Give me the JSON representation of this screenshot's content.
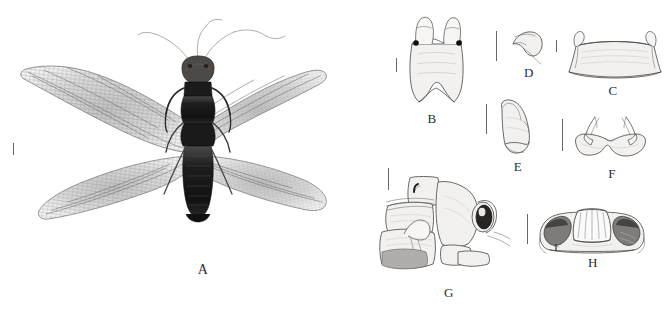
{
  "figure": {
    "type": "scientific-plate",
    "background_color": "#ffffff",
    "ink_color": "#4a4a4a",
    "label_color": "#2b2b2b",
    "panels": [
      {
        "id": "A",
        "label": "A",
        "kind": "photograph",
        "content": "Dorsal habitus photograph of adult specimen with outspread fore and hind wings, long antennae and dark elongate abdomen",
        "has_scale_bar": true
      },
      {
        "id": "B",
        "label": "B",
        "kind": "line-drawing",
        "content": "Male ninth tergite with paired dorsal processes and two dark sclerotized spots, ventral view",
        "has_scale_bar": true
      },
      {
        "id": "C",
        "label": "C",
        "kind": "line-drawing",
        "content": "Broad trapezoidal plate with paired small hooked lateral projections",
        "has_scale_bar": true
      },
      {
        "id": "D",
        "label": "D",
        "kind": "line-drawing",
        "content": "Small hook-shaped sclerite, lateral view",
        "has_scale_bar": true
      },
      {
        "id": "E",
        "label": "E",
        "kind": "line-drawing",
        "content": "Elongate tapering gonocoxite segment, lateral view",
        "has_scale_bar": true
      },
      {
        "id": "F",
        "label": "F",
        "kind": "line-drawing",
        "content": "Bilobed base bearing a pair of slender curved horns, posterior view",
        "has_scale_bar": true
      },
      {
        "id": "G",
        "label": "G",
        "kind": "line-drawing",
        "content": "Terminal abdominal segments and genitalia, lateral view, with dark rounded sclerite",
        "has_scale_bar": true
      },
      {
        "id": "H",
        "label": "H",
        "kind": "line-drawing",
        "content": "Broad sclerite with central striated trapezoidal plate and dark lateral lobes",
        "has_scale_bar": true
      }
    ]
  }
}
